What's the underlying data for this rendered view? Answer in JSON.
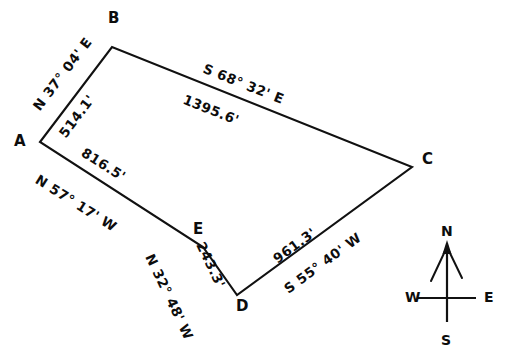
{
  "figure": {
    "type": "survey-plat-diagram",
    "canvas": {
      "width": 510,
      "height": 363
    },
    "background_color": "#ffffff",
    "line_color": "#111111",
    "text_color": "#0d0d0d"
  },
  "vertices": [
    {
      "id": "A",
      "label": "A",
      "x": 40,
      "y": 142,
      "label_x": 14,
      "label_y": 134
    },
    {
      "id": "B",
      "label": "B",
      "x": 112,
      "y": 47,
      "label_x": 108,
      "label_y": 11
    },
    {
      "id": "C",
      "label": "C",
      "x": 412,
      "y": 167,
      "label_x": 422,
      "label_y": 152
    },
    {
      "id": "D",
      "label": "D",
      "x": 237,
      "y": 295,
      "label_x": 236,
      "label_y": 299
    },
    {
      "id": "E",
      "label": "E",
      "x": 203,
      "y": 247,
      "label_x": 193,
      "label_y": 222
    }
  ],
  "polygon_path": "M 40 142 L 112 47 L 412 167 L 237 295 L 203 247 Z",
  "courses": [
    {
      "id": "AB",
      "from": "A",
      "to": "B",
      "bearing": "N 37° 04' E",
      "distance": "514.1'",
      "bearing_pos": {
        "x": 31,
        "y": 105,
        "rotate": -52.8
      },
      "distance_pos": {
        "x": 57,
        "y": 132,
        "rotate": -52.8
      }
    },
    {
      "id": "BC",
      "from": "B",
      "to": "C",
      "bearing": "S 68° 32' E",
      "distance": "1395.6'",
      "bearing_pos": {
        "x": 206,
        "y": 62,
        "rotate": 21.8
      },
      "distance_pos": {
        "x": 186,
        "y": 93,
        "rotate": 21.8
      }
    },
    {
      "id": "CD",
      "from": "C",
      "to": "D",
      "bearing": "S 55° 40' W",
      "distance": "961.3'",
      "bearing_pos": {
        "x": 282,
        "y": 285,
        "rotate": -36.2
      },
      "distance_pos": {
        "x": 271,
        "y": 255,
        "rotate": -36.2
      }
    },
    {
      "id": "DE",
      "from": "D",
      "to": "E",
      "bearing": "N 32° 48' W",
      "distance": "243.3'",
      "bearing_pos": {
        "x": 155,
        "y": 252,
        "rotate": 64.5
      },
      "distance_pos": {
        "x": 206,
        "y": 240,
        "rotate": 64.5
      }
    },
    {
      "id": "EA",
      "from": "E",
      "to": "A",
      "bearing": "N 57° 17' W",
      "distance": "816.5'",
      "bearing_pos": {
        "x": 40,
        "y": 173,
        "rotate": 32.2
      },
      "distance_pos": {
        "x": 86,
        "y": 146,
        "rotate": 32.2
      }
    }
  ],
  "compass": {
    "name": "compass-rose",
    "center": {
      "x": 447,
      "y": 298
    },
    "north": {
      "label": "N",
      "x": 441,
      "y": 224
    },
    "south": {
      "label": "S",
      "x": 441,
      "y": 333
    },
    "east": {
      "label": "E",
      "x": 484,
      "y": 290
    },
    "west": {
      "label": "W",
      "x": 405,
      "y": 290
    }
  }
}
